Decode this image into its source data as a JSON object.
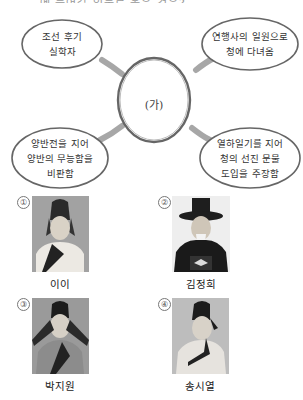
{
  "question": {
    "clipped_header_text": "……에 들어갈 인물로 옳은 것은?"
  },
  "mindmap": {
    "center_label": "(가)",
    "nodes": [
      {
        "position": "top-left",
        "text": "조선 후기\n실학자"
      },
      {
        "position": "top-right",
        "text": "연행사의 일원으로\n청에 다녀옴"
      },
      {
        "position": "bottom-left",
        "text": "양반전을 지어\n양반의 무능함을\n비판함"
      },
      {
        "position": "bottom-right",
        "text": "열하일기를 지어\n청의 선진 문물\n도입을 주장함"
      }
    ]
  },
  "choices": [
    {
      "number": "①",
      "name": "이이"
    },
    {
      "number": "②",
      "name": "김정희"
    },
    {
      "number": "③",
      "name": "박지원"
    },
    {
      "number": "④",
      "name": "송시열"
    }
  ]
}
